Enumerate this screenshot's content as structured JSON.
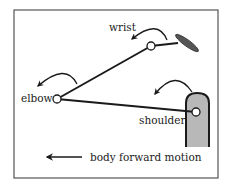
{
  "diagram": {
    "type": "biomechanics kinematic chain",
    "labels": {
      "wrist": "wrist",
      "elbow": "elbow",
      "shoulder": "shoulder"
    },
    "caption": "body forward motion",
    "joints": [
      {
        "name": "wrist",
        "x": 151,
        "y": 46
      },
      {
        "name": "elbow",
        "x": 57,
        "y": 99
      },
      {
        "name": "shoulder",
        "x": 196,
        "y": 112
      }
    ],
    "segments": [
      {
        "from": "elbow",
        "to": "wrist"
      },
      {
        "from": "elbow",
        "to": "shoulder"
      },
      {
        "from": "wrist",
        "to": "hand"
      }
    ],
    "rotation_arrows": [
      "wrist",
      "elbow",
      "shoulder"
    ],
    "colors": {
      "line": "#1a1a1a",
      "torso_fill": "#b8b8b8",
      "hand_fill": "#555555",
      "frame": "#555555",
      "joint_fill": "#ffffff"
    }
  }
}
